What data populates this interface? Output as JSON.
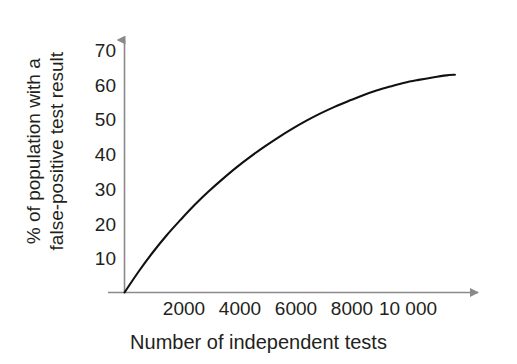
{
  "figure": {
    "background_color": "#ffffff",
    "axis_color": "#8a8a8a",
    "curve_color": "#111111",
    "text_color": "#231f20"
  },
  "chart_data": {
    "type": "line",
    "title": "",
    "xlabel": "Number of independent tests",
    "ylabel_line1": "% of population with a",
    "ylabel_line2": "false-positive test result",
    "ylabel": "% of population with a false-positive test result",
    "xlim": [
      0,
      12800
    ],
    "ylim": [
      0,
      73
    ],
    "grid": false,
    "legend": "none",
    "xticks": [
      2000,
      4000,
      6000,
      8000,
      10000
    ],
    "xtick_labels": [
      "2000",
      "4000",
      "6000",
      "8000",
      "10 000"
    ],
    "yticks": [
      10,
      20,
      30,
      40,
      50,
      60,
      70
    ],
    "ytick_labels": [
      "10",
      "20",
      "30",
      "40",
      "50",
      "60",
      "70"
    ],
    "series": [
      {
        "name": "% of population with a false-positive test result",
        "x": [
          0,
          500,
          1000,
          1500,
          2000,
          2500,
          3000,
          3500,
          4000,
          4500,
          5000,
          5500,
          6000,
          6500,
          7000,
          7500,
          8000,
          8500,
          9000,
          9500,
          10000,
          10500,
          11000,
          11500,
          11800
        ],
        "values": [
          0,
          6.0,
          11.5,
          16.5,
          21.0,
          25.3,
          29.2,
          32.8,
          36.2,
          39.3,
          42.2,
          44.9,
          47.4,
          49.7,
          51.8,
          53.7,
          55.4,
          57.0,
          58.4,
          59.6,
          60.7,
          61.5,
          62.2,
          62.8,
          63.0
        ]
      }
    ],
    "annotations": []
  },
  "axes": {
    "x_axis_arrow": "arrow-right-icon",
    "y_axis_arrow": "arrow-up-icon"
  }
}
